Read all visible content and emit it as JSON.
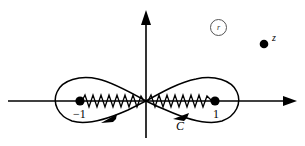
{
  "figure": {
    "type": "complex-plane-contour-diagram",
    "background_color": "#ffffff",
    "stroke_color": "#000000"
  },
  "axes": {
    "real_axis": {
      "name": "horizontal-axis",
      "arrow_at": "right",
      "y": 101,
      "x_start": 8,
      "x_end": 297
    },
    "imaginary_axis": {
      "name": "vertical-axis",
      "arrow_at": "top",
      "x": 146,
      "y_start": 10,
      "y_end": 138
    }
  },
  "branch_points": [
    {
      "label": "−1",
      "x": -1,
      "px": 80,
      "py": 101
    },
    {
      "label": "1",
      "x": 1,
      "px": 215,
      "py": 101
    }
  ],
  "branch_cuts": [
    {
      "name": "left-branch-cut",
      "from_px": 80,
      "to_px": 146,
      "style": "zigzag"
    },
    {
      "name": "right-branch-cut",
      "from_px": 146,
      "to_px": 215,
      "style": "zigzag"
    }
  ],
  "contour": {
    "label": "C",
    "shape": "figure-eight",
    "crossing_point_px": [
      146,
      101
    ],
    "direction_markers": 2
  },
  "points": [
    {
      "label": "z",
      "px": 264,
      "py": 44
    }
  ],
  "annotations": [
    {
      "label": "r",
      "style": "circled",
      "px": 217,
      "py": 26
    }
  ],
  "labels": {
    "minus_one": "−1",
    "plus_one": "1",
    "contour": "C",
    "point_z": "z",
    "circled_note": "r"
  }
}
